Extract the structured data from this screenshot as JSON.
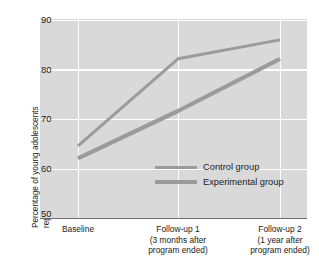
{
  "chart_data": {
    "type": "line",
    "title": "",
    "xlabel": "",
    "ylabel_line1": "Percentage of young adolescents",
    "ylabel_line2": "reporting alcohol use in their lifetime",
    "categories": [
      "Baseline",
      "Follow-up 1",
      "Follow-up 2"
    ],
    "category_sublabels": [
      [
        "Baseline"
      ],
      [
        "Follow-up 1",
        "(3 months after",
        "program ended)"
      ],
      [
        "Follow-up 2",
        "(1 year after",
        "program ended)"
      ]
    ],
    "ylim": [
      50,
      90
    ],
    "yticks": [
      90,
      80,
      70,
      60,
      50
    ],
    "ytick_labels": [
      "90",
      "80",
      "70",
      "60",
      "50"
    ],
    "grid": true,
    "legend_position": "inside-bottom-right",
    "series": [
      {
        "name": "Control group",
        "values": [
          64.5,
          82.0,
          85.8
        ],
        "color": "#9b9b9b",
        "line_width": 3.0
      },
      {
        "name": "Experimental group",
        "values": [
          62.0,
          71.5,
          82.0
        ],
        "color": "#9b9b9b",
        "line_width": 4.2
      }
    ],
    "plot_background": "#d9d9d9",
    "grid_color": "#ffffff",
    "axis_color": "#6f6f6f"
  }
}
